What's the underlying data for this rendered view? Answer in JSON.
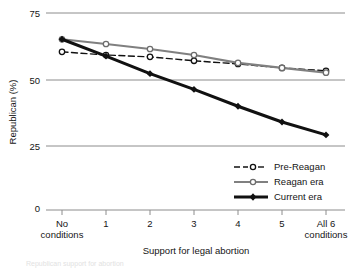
{
  "chart_data": {
    "type": "line",
    "title": "",
    "xlabel": "Support for legal abortion",
    "ylabel": "Republican (%)",
    "categories": [
      "No conditions",
      "1",
      "2",
      "3",
      "4",
      "5",
      "All 6 conditions"
    ],
    "x_tick_labels_multiline": [
      [
        "No",
        "conditions"
      ],
      [
        "1"
      ],
      [
        "2"
      ],
      [
        "3"
      ],
      [
        "4"
      ],
      [
        "5"
      ],
      [
        "All 6",
        "conditions"
      ]
    ],
    "y_ticks": [
      0,
      25,
      50,
      75
    ],
    "y_tick_labels": [
      "0",
      "25",
      "50",
      "75"
    ],
    "ylim": [
      0,
      75
    ],
    "grid": "horizontal",
    "legend_position": "lower-right",
    "series": [
      {
        "name": "Pre-Reagan",
        "line_style": "dashed",
        "color": "#111111",
        "marker": "open-circle",
        "values": [
          60.2,
          59.0,
          58.3,
          56.8,
          55.6,
          54.1,
          53.0
        ]
      },
      {
        "name": "Reagan era",
        "line_style": "solid",
        "color": "#808080",
        "marker": "open-circle",
        "values": [
          65.0,
          63.2,
          61.3,
          59.0,
          56.0,
          54.1,
          52.3
        ]
      },
      {
        "name": "Current era",
        "line_style": "solid-thick",
        "color": "#111111",
        "marker": "filled-diamond",
        "values": [
          65.0,
          58.6,
          51.9,
          45.9,
          39.5,
          33.5,
          28.6
        ]
      }
    ]
  },
  "legend": {
    "entries": [
      "Pre-Reagan",
      "Reagan era",
      "Current era"
    ]
  },
  "caption_fragment": "Republican support for abortion"
}
